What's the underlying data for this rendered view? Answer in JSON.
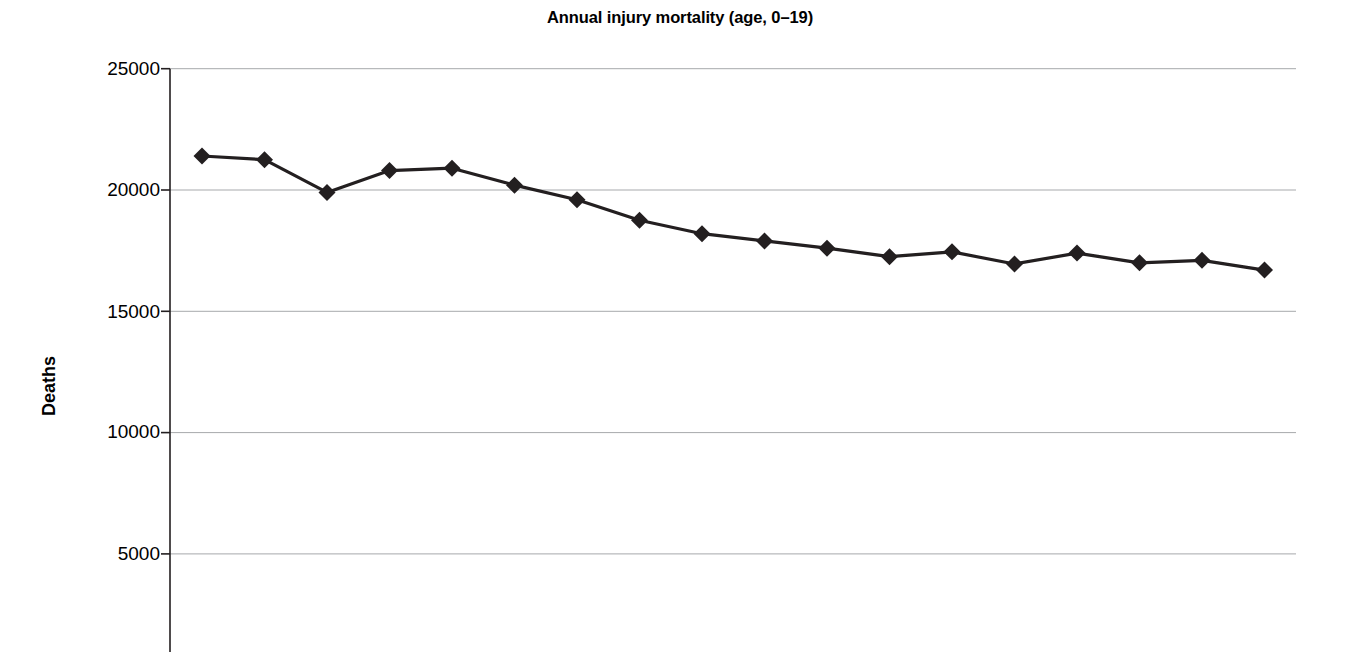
{
  "chart_data": {
    "type": "line",
    "title": "Annual injury mortality (age, 0–19)",
    "xlabel": "",
    "ylabel": "Deaths",
    "ylim": [
      0,
      25000
    ],
    "ytick_labels": [
      "25000",
      "20000",
      "15000",
      "10000",
      "5000"
    ],
    "ytick_values": [
      25000,
      20000,
      15000,
      10000,
      5000
    ],
    "grid": "horizontal",
    "legend": "none",
    "marker": "filled-diamond",
    "line_color": "#231f20",
    "marker_color": "#231f20",
    "grid_color": "#a7a9ac",
    "x": [
      1,
      2,
      3,
      4,
      5,
      6,
      7,
      8,
      9,
      10,
      11,
      12,
      13,
      14,
      15,
      16,
      17,
      18
    ],
    "values": [
      21400,
      21250,
      19900,
      20800,
      20900,
      20200,
      19600,
      18750,
      18200,
      17900,
      17600,
      17250,
      17450,
      16950,
      17400,
      17000,
      17100,
      16700
    ],
    "series": [
      {
        "name": "Annual injury mortality, ages 0-19",
        "values": [
          21400,
          21250,
          19900,
          20800,
          20900,
          20200,
          19600,
          18750,
          18200,
          17900,
          17600,
          17250,
          17450,
          16950,
          17400,
          17000,
          17100,
          16700
        ]
      }
    ],
    "annotations": []
  },
  "chart": {
    "title": "Annual injury mortality (age, 0–19)",
    "yaxis_title": "Deaths"
  }
}
